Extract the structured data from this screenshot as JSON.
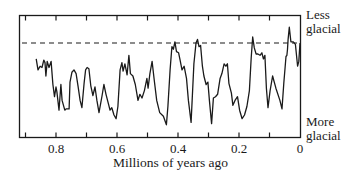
{
  "chart_data": {
    "type": "line",
    "title": "",
    "xlabel": "Millions of years ago",
    "ylabel": "",
    "x_axis": {
      "reversed": true,
      "ticks": [
        0.8,
        0.6,
        0.4,
        0.2,
        0
      ],
      "tick_labels": [
        "0.8",
        "0.6",
        "0.4",
        "0.2",
        "0"
      ],
      "minor_ticks": [
        0.9,
        0.7,
        0.5,
        0.3,
        0.1
      ],
      "range": [
        0.92,
        0
      ]
    },
    "y_axis": {
      "top_label": "Less glacial",
      "bottom_label": "More glacial",
      "range": [
        0,
        100
      ],
      "units": "relative glacial index (100 = less glacial)"
    },
    "reference_line": {
      "style": "dashed",
      "value": 77,
      "description": "present-day level"
    },
    "grid": false,
    "legend": null,
    "series": [
      {
        "name": "Climate record",
        "points": [
          [
            0.865,
            64
          ],
          [
            0.859,
            55
          ],
          [
            0.852,
            58
          ],
          [
            0.846,
            57
          ],
          [
            0.84,
            63
          ],
          [
            0.836,
            61
          ],
          [
            0.833,
            50
          ],
          [
            0.829,
            62
          ],
          [
            0.823,
            57
          ],
          [
            0.816,
            62
          ],
          [
            0.81,
            43
          ],
          [
            0.805,
            33
          ],
          [
            0.8,
            41
          ],
          [
            0.797,
            37
          ],
          [
            0.79,
            22
          ],
          [
            0.784,
            43
          ],
          [
            0.78,
            30
          ],
          [
            0.771,
            22
          ],
          [
            0.767,
            23
          ],
          [
            0.757,
            23
          ],
          [
            0.754,
            45
          ],
          [
            0.748,
            53
          ],
          [
            0.741,
            55
          ],
          [
            0.734,
            52
          ],
          [
            0.728,
            42
          ],
          [
            0.721,
            30
          ],
          [
            0.715,
            24
          ],
          [
            0.708,
            44
          ],
          [
            0.703,
            55
          ],
          [
            0.698,
            57
          ],
          [
            0.692,
            56
          ],
          [
            0.686,
            42
          ],
          [
            0.679,
            34
          ],
          [
            0.672,
            41
          ],
          [
            0.666,
            30
          ],
          [
            0.659,
            20
          ],
          [
            0.649,
            34
          ],
          [
            0.643,
            43
          ],
          [
            0.636,
            35
          ],
          [
            0.628,
            27
          ],
          [
            0.623,
            22
          ],
          [
            0.617,
            24
          ],
          [
            0.61,
            18
          ],
          [
            0.603,
            15
          ],
          [
            0.597,
            25
          ],
          [
            0.59,
            55
          ],
          [
            0.584,
            61
          ],
          [
            0.58,
            54
          ],
          [
            0.574,
            60
          ],
          [
            0.567,
            51
          ],
          [
            0.561,
            67
          ],
          [
            0.556,
            52
          ],
          [
            0.548,
            50
          ],
          [
            0.54,
            43
          ],
          [
            0.531,
            30
          ],
          [
            0.525,
            35
          ],
          [
            0.518,
            32
          ],
          [
            0.51,
            38
          ],
          [
            0.502,
            48
          ],
          [
            0.498,
            40
          ],
          [
            0.492,
            52
          ],
          [
            0.485,
            62
          ],
          [
            0.478,
            47
          ],
          [
            0.47,
            30
          ],
          [
            0.46,
            20
          ],
          [
            0.448,
            17
          ],
          [
            0.438,
            10
          ],
          [
            0.433,
            25
          ],
          [
            0.426,
            55
          ],
          [
            0.42,
            74
          ],
          [
            0.415,
            72
          ],
          [
            0.41,
            78
          ],
          [
            0.405,
            70
          ],
          [
            0.398,
            69
          ],
          [
            0.393,
            63
          ],
          [
            0.387,
            55
          ],
          [
            0.38,
            58
          ],
          [
            0.372,
            48
          ],
          [
            0.366,
            30
          ],
          [
            0.357,
            12
          ],
          [
            0.348,
            60
          ],
          [
            0.341,
            77
          ],
          [
            0.336,
            80
          ],
          [
            0.331,
            74
          ],
          [
            0.326,
            75
          ],
          [
            0.32,
            58
          ],
          [
            0.315,
            50
          ],
          [
            0.308,
            43
          ],
          [
            0.302,
            45
          ],
          [
            0.297,
            30
          ],
          [
            0.29,
            11
          ],
          [
            0.284,
            32
          ],
          [
            0.277,
            33
          ],
          [
            0.27,
            35
          ],
          [
            0.262,
            48
          ],
          [
            0.256,
            52
          ],
          [
            0.249,
            60
          ],
          [
            0.243,
            58
          ],
          [
            0.238,
            60
          ],
          [
            0.233,
            44
          ],
          [
            0.225,
            36
          ],
          [
            0.22,
            26
          ],
          [
            0.213,
            30
          ],
          [
            0.205,
            33
          ],
          [
            0.198,
            22
          ],
          [
            0.19,
            15
          ],
          [
            0.182,
            18
          ],
          [
            0.174,
            25
          ],
          [
            0.166,
            38
          ],
          [
            0.16,
            65
          ],
          [
            0.155,
            82
          ],
          [
            0.15,
            73
          ],
          [
            0.144,
            68
          ],
          [
            0.138,
            68
          ],
          [
            0.131,
            67
          ],
          [
            0.125,
            69
          ],
          [
            0.12,
            64
          ],
          [
            0.115,
            67
          ],
          [
            0.11,
            40
          ],
          [
            0.105,
            24
          ],
          [
            0.098,
            38
          ],
          [
            0.09,
            50
          ],
          [
            0.079,
            40
          ],
          [
            0.066,
            30
          ],
          [
            0.059,
            23
          ],
          [
            0.053,
            44
          ],
          [
            0.049,
            57
          ],
          [
            0.046,
            66
          ],
          [
            0.043,
            67
          ],
          [
            0.041,
            72
          ],
          [
            0.039,
            80
          ],
          [
            0.035,
            90
          ],
          [
            0.03,
            78
          ],
          [
            0.022,
            78
          ],
          [
            0.015,
            76
          ],
          [
            0.008,
            58
          ],
          [
            0.004,
            62
          ],
          [
            0.0,
            77
          ]
        ]
      }
    ]
  },
  "labels": {
    "top_right_line1": "Less",
    "top_right_line2": "glacial",
    "bottom_right_line1": "More",
    "bottom_right_line2": "glacial",
    "x_axis_title": "Millions of years ago",
    "ticks": [
      "0.8",
      "0.6",
      "0.4",
      "0.2",
      "0"
    ]
  }
}
